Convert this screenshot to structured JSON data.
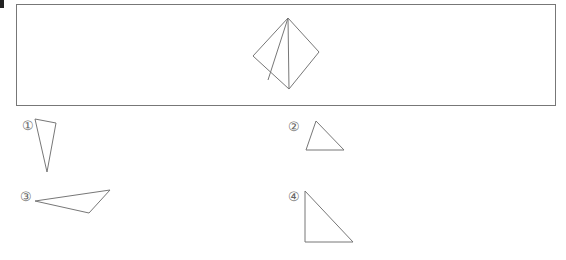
{
  "question_marker": "",
  "main_figure": {
    "description": "square folded into triangles (diamond shape with two inner lines)",
    "stroke_color": "#777777",
    "outline": [
      [
        288,
        18
      ],
      [
        319,
        52
      ],
      [
        289,
        89
      ],
      [
        253,
        56
      ]
    ],
    "inner_lines": [
      [
        [
          288,
          18
        ],
        [
          268,
          80
        ]
      ],
      [
        [
          288,
          18
        ],
        [
          289,
          89
        ]
      ]
    ]
  },
  "options": [
    {
      "label": "①",
      "label_pos": [
        22,
        119
      ],
      "points": [
        [
          35,
          119
        ],
        [
          56,
          123
        ],
        [
          47,
          172
        ]
      ]
    },
    {
      "label": "②",
      "label_pos": [
        288,
        120
      ],
      "points": [
        [
          316,
          121
        ],
        [
          306,
          150
        ],
        [
          344,
          150
        ]
      ]
    },
    {
      "label": "③",
      "label_pos": [
        20,
        190
      ],
      "points": [
        [
          35,
          201
        ],
        [
          110,
          190
        ],
        [
          89,
          213
        ]
      ]
    },
    {
      "label": "④",
      "label_pos": [
        288,
        190
      ],
      "points": [
        [
          305,
          191
        ],
        [
          305,
          242
        ],
        [
          353,
          242
        ]
      ]
    }
  ]
}
